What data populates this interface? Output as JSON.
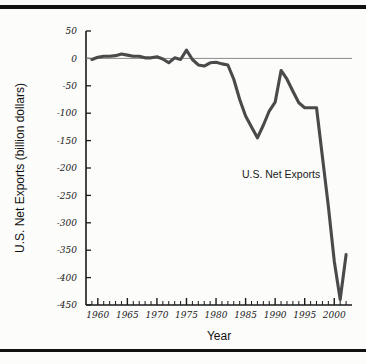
{
  "figure": {
    "background_color": "#fcfcfa",
    "rule_color": "#111111"
  },
  "chart_data": {
    "type": "line",
    "title": "",
    "xlabel": "Year",
    "ylabel": "U.S. Net Exports (billion dollars)",
    "xlim": [
      1958,
      2003
    ],
    "ylim": [
      -450,
      50
    ],
    "ytick_step": 50,
    "xtick_step": 1,
    "xtick_label_step": 5,
    "grid": false,
    "legend": "none",
    "zero_line": true,
    "line_color": "#4a4a4a",
    "series": [
      {
        "name": "U.S. Net Exports",
        "x": [
          1959,
          1960,
          1961,
          1962,
          1963,
          1964,
          1965,
          1966,
          1967,
          1968,
          1969,
          1970,
          1971,
          1972,
          1973,
          1974,
          1975,
          1976,
          1977,
          1978,
          1979,
          1980,
          1981,
          1982,
          1983,
          1984,
          1985,
          1986,
          1987,
          1988,
          1989,
          1990,
          1991,
          1992,
          1993,
          1994,
          1995,
          1996,
          1997,
          1998,
          1999,
          2000,
          2001,
          2002
        ],
        "values": [
          -2,
          2,
          4,
          4,
          5,
          8,
          6,
          4,
          4,
          1,
          1,
          3,
          -1,
          -8,
          1,
          -2,
          15,
          -2,
          -12,
          -14,
          -8,
          -7,
          -10,
          -12,
          -38,
          -75,
          -105,
          -125,
          -145,
          -122,
          -96,
          -80,
          -22,
          -38,
          -60,
          -81,
          -90,
          -90,
          -90,
          -180,
          -270,
          -370,
          -440,
          -358
        ]
      }
    ],
    "annotations": [
      {
        "text": "U.S. Net Exports",
        "x": 1991,
        "y": -218
      }
    ],
    "ytick_labels": [
      "50",
      "0",
      "-50",
      "-100",
      "-150",
      "-200",
      "-250",
      "-300",
      "-350",
      "-400",
      "-450"
    ],
    "xtick_labels": [
      "1960",
      "1965",
      "1970",
      "1975",
      "1980",
      "1985",
      "1990",
      "1995",
      "2000"
    ]
  }
}
